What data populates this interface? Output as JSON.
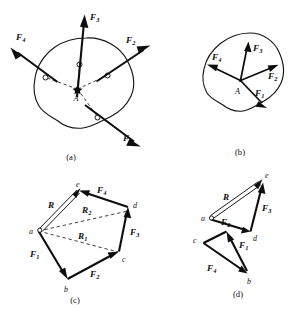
{
  "figure": {
    "background_color": "#ffffff",
    "ink_color": "#0d0d0d",
    "panels": [
      {
        "id": "a",
        "caption": "(a)",
        "description": "Rigid body with four non-concurrent applied forces whose lines of action pass through point A",
        "point_label": "A",
        "force_labels": [
          "F1",
          "F2",
          "F3",
          "F4"
        ]
      },
      {
        "id": "b",
        "caption": "(b)",
        "description": "Forces transmitted along their lines of action to the common point A",
        "point_label": "A",
        "force_labels": [
          "F1",
          "F2",
          "F3",
          "F4"
        ]
      },
      {
        "id": "c",
        "caption": "(c)",
        "description": "Force polygon a-b-c-d-e with partial resultants R1, R2 and total resultant R",
        "vertices": [
          "a",
          "b",
          "c",
          "d",
          "e"
        ],
        "edges": [
          "F1",
          "F2",
          "F3",
          "F4"
        ],
        "resultants": [
          "R1",
          "R2",
          "R"
        ]
      },
      {
        "id": "d",
        "caption": "(d)",
        "description": "Force polygon drawn with the forces added in a different order, giving the same resultant R",
        "vertices": [
          "a",
          "b",
          "c",
          "d",
          "e"
        ],
        "edges": [
          "F1",
          "F2",
          "F3",
          "F4"
        ],
        "resultants": [
          "R"
        ]
      }
    ],
    "labels": {
      "A": "A",
      "a": "a",
      "b": "b",
      "c": "c",
      "d": "d",
      "e": "e",
      "F_base": "F",
      "R_base": "R",
      "sub1": "1",
      "sub2": "2",
      "sub3": "3",
      "sub4": "4"
    },
    "captions": {
      "a": "(a)",
      "b": "(b)",
      "c": "(c)",
      "d": "(d)"
    }
  }
}
